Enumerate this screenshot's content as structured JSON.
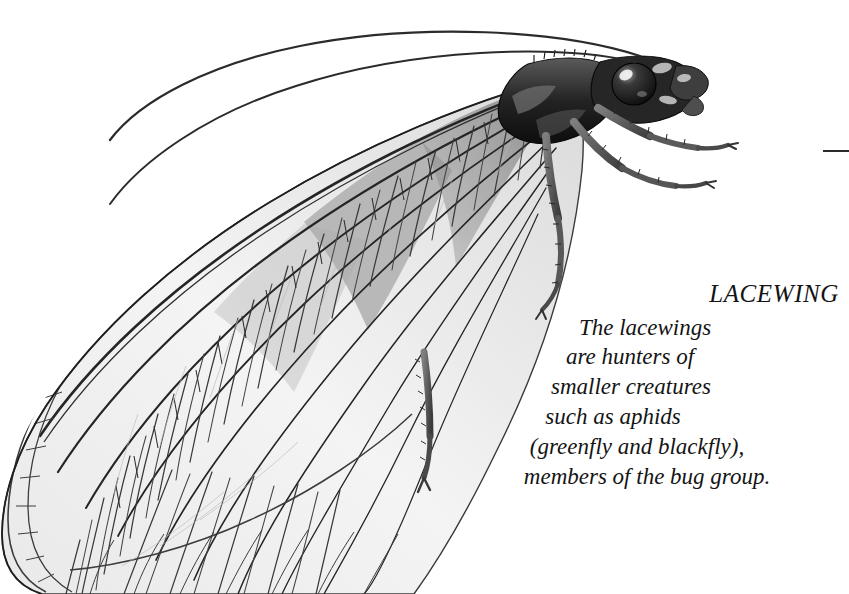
{
  "image": {
    "subject": "lacewing",
    "style": "monochrome pen-and-ink naturalist illustration",
    "background_color": "#ffffff",
    "ink_color": "#1c1c1c",
    "width": 849,
    "height": 594
  },
  "caption": {
    "title": "LACEWING",
    "lines": [
      "The lacewings",
      "are hunters of",
      "smaller creatures",
      "such as aphids",
      "(greenfly and blackfly),",
      "members of the bug group."
    ]
  },
  "figure_parts": {
    "forewing": "forewing",
    "hindwing": "hindwing",
    "antenna_upper": "upper-antenna",
    "antenna_lower": "lower-antenna",
    "head": "head",
    "compound_eye": "compound-eye",
    "thorax": "thorax",
    "foreleg": "foreleg",
    "midleg": "midleg",
    "hindleg": "hindleg",
    "wing_venation": "wing-venation-cells",
    "edge_rule": "edge-rule-mark"
  }
}
